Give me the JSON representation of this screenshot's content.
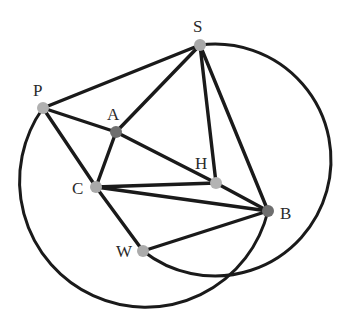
{
  "diagram": {
    "type": "geometry-figure",
    "points": [
      {
        "id": "S",
        "label": "S",
        "x": 200,
        "y": 45,
        "lx": 193,
        "ly": 32,
        "color": "#a9a9a9"
      },
      {
        "id": "P",
        "label": "P",
        "x": 43,
        "y": 108,
        "lx": 33,
        "ly": 96,
        "color": "#b0b0b0"
      },
      {
        "id": "A",
        "label": "A",
        "x": 116,
        "y": 132,
        "lx": 107,
        "ly": 120,
        "color": "#6e6e6e"
      },
      {
        "id": "H",
        "label": "H",
        "x": 216,
        "y": 183,
        "lx": 195,
        "ly": 169,
        "color": "#b3b3b3"
      },
      {
        "id": "C",
        "label": "C",
        "x": 96,
        "y": 187,
        "lx": 72,
        "ly": 194,
        "color": "#a9a9a9"
      },
      {
        "id": "B",
        "label": "B",
        "x": 268,
        "y": 211,
        "lx": 280,
        "ly": 219,
        "color": "#6e6e6e"
      },
      {
        "id": "W",
        "label": "W",
        "x": 143,
        "y": 251,
        "lx": 116,
        "ly": 257,
        "color": "#ababab"
      }
    ],
    "segments": [
      [
        "P",
        "S"
      ],
      [
        "P",
        "A"
      ],
      [
        "A",
        "H"
      ],
      [
        "P",
        "C"
      ],
      [
        "S",
        "A"
      ],
      [
        "S",
        "H"
      ],
      [
        "S",
        "B"
      ],
      [
        "A",
        "C"
      ],
      [
        "C",
        "H"
      ],
      [
        "C",
        "B"
      ],
      [
        "C",
        "W"
      ],
      [
        "H",
        "B"
      ],
      [
        "W",
        "B"
      ]
    ],
    "arcs": [
      {
        "name": "right-circle-arc",
        "from": "S",
        "to": "W",
        "rx": 116,
        "ry": 116,
        "large": 1,
        "sweep": 1
      },
      {
        "name": "left-circle-arc",
        "from": "P",
        "to": "B",
        "rx": 126,
        "ry": 126,
        "large": 1,
        "sweep": 0
      }
    ]
  }
}
